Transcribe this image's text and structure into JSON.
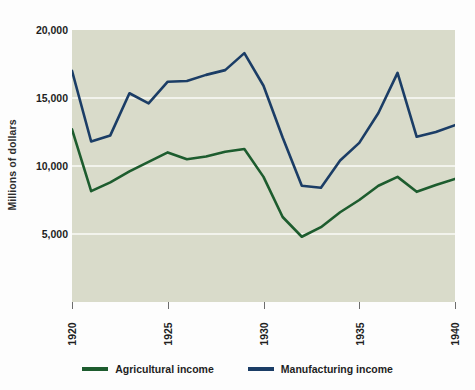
{
  "chart_data": {
    "type": "line",
    "title": "",
    "subtitle": "",
    "xlabel": "",
    "ylabel": "Millions of dollars",
    "x": [
      1920,
      1921,
      1922,
      1923,
      1924,
      1925,
      1926,
      1927,
      1928,
      1929,
      1930,
      1931,
      1932,
      1933,
      1934,
      1935,
      1936,
      1937,
      1938,
      1939,
      1940
    ],
    "xlim": [
      1920,
      1940
    ],
    "ylim": [
      0,
      20000
    ],
    "xtick_labels": [
      "1920",
      "1925",
      "1930",
      "1935",
      "1940"
    ],
    "xtick_values": [
      1920,
      1925,
      1930,
      1935,
      1940
    ],
    "ytick_labels": [
      "20,000",
      "15,000",
      "10,000",
      "5,000"
    ],
    "ytick_values": [
      20000,
      15000,
      10000,
      5000
    ],
    "grid": "horizontal",
    "grid_color": "#f2f3ec",
    "plot_background": "#d9dbca",
    "legend_position": "bottom",
    "series": [
      {
        "name": "Agricultural income",
        "color": "#1d5c2e",
        "values": [
          12700,
          8150,
          8800,
          9600,
          10300,
          11000,
          10500,
          10700,
          11050,
          11250,
          9200,
          6250,
          4800,
          5500,
          6600,
          7500,
          8550,
          9200,
          8100,
          8600,
          9050
        ]
      },
      {
        "name": "Manufacturing income",
        "color": "#1b3d66",
        "values": [
          17000,
          11800,
          12250,
          15350,
          14600,
          16200,
          16250,
          16700,
          17050,
          18300,
          15900,
          12100,
          8550,
          8400,
          10400,
          11700,
          13900,
          16850,
          12150,
          12500,
          13000
        ]
      }
    ]
  },
  "axis": {
    "y_title": "Millions of dollars"
  },
  "legend": {
    "items": [
      {
        "label": "Agricultural income",
        "color": "#1d5c2e"
      },
      {
        "label": "Manufacturing income",
        "color": "#1b3d66"
      }
    ]
  }
}
